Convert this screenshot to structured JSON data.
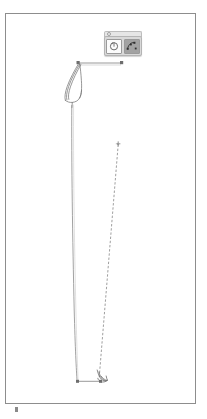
{
  "app": {
    "name": "vector-drawing-canvas",
    "background_color": "#ffffff"
  },
  "canvas": {
    "name": "drawing-sheet",
    "border_color": "#8d8d8d",
    "fill_color": "#ffffff",
    "x": 5,
    "y": 13,
    "width": 191,
    "height": 391
  },
  "tool_popup": {
    "name": "floating-tool-palette",
    "background_color": "#d9d9d9",
    "header_color": "#e6e6e6",
    "buttons": [
      {
        "name": "rotate-tool-button",
        "icon": "circle-rotate-icon",
        "state": "unselected",
        "background_color": "#fbfbfb"
      },
      {
        "name": "node-edit-tool-button",
        "icon": "node-points-icon",
        "state": "selected",
        "background_color": "#a2a2a2"
      }
    ]
  },
  "drawing": {
    "stroke_color": "#6f6f6f",
    "guide_color": "#9a9a9a",
    "handle_color": "#7b7b7b",
    "elements": [
      {
        "name": "top-dimension-line",
        "type": "measure-line",
        "x1": 78,
        "y1": 63,
        "x2": 122,
        "y2": 63
      },
      {
        "name": "top-dimension-handle-left",
        "type": "square-handle",
        "x": 78,
        "y": 63
      },
      {
        "name": "top-dimension-handle-right",
        "type": "square-handle",
        "x": 122,
        "y": 63
      },
      {
        "name": "club-head-outline",
        "type": "curved-blade",
        "anchor_x": 72,
        "anchor_y": 66
      },
      {
        "name": "shaft-line",
        "type": "solid-path",
        "x1": 72,
        "y1": 104,
        "x2": 77,
        "y2": 381
      },
      {
        "name": "guide-dashed-line",
        "type": "dashed-path",
        "x1": 118,
        "y1": 143,
        "x2": 99,
        "y2": 378
      },
      {
        "name": "guide-dashed-endpoint",
        "type": "point-handle",
        "x": 118,
        "y": 143
      },
      {
        "name": "bottom-dimension-line",
        "type": "measure-line",
        "x1": 77,
        "y1": 381,
        "x2": 101,
        "y2": 381
      },
      {
        "name": "bottom-hook-outline",
        "type": "curved-hook",
        "anchor_x": 99,
        "anchor_y": 377
      },
      {
        "name": "sheet-corner-tick",
        "type": "tick-mark",
        "x": 16,
        "y": 409
      }
    ]
  }
}
